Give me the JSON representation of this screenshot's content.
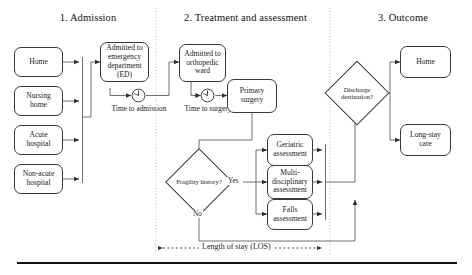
{
  "diagram": {
    "title_phases": [
      {
        "id": "phase-1",
        "label": "1. Admission"
      },
      {
        "id": "phase-2",
        "label": "2. Treatment and assessment"
      },
      {
        "id": "phase-3",
        "label": "3. Outcome"
      }
    ],
    "admission": {
      "sources": [
        {
          "id": "source-home",
          "label": "Home"
        },
        {
          "id": "source-nursing-home",
          "label": "Nursing home"
        },
        {
          "id": "source-acute-hospital",
          "label": "Acute hospital"
        },
        {
          "id": "source-non-acute-hospital",
          "label": "Non-acute hospital"
        }
      ],
      "ed_node": "Admitted to emergency department (ED)",
      "time_to_admission": "Time to admission"
    },
    "treatment": {
      "ward_node": "Admitted to orthopedic ward",
      "time_to_surgery": "Time to surgery",
      "primary_surgery": "Primary surgery",
      "decision": "Fragility history?",
      "decision_yes": "Yes",
      "decision_no": "No",
      "assessments": [
        {
          "id": "assessment-geriatric",
          "label": "Geriatric assessment"
        },
        {
          "id": "assessment-multidisciplinary",
          "label": "Multi-disciplinary assessment"
        },
        {
          "id": "assessment-falls",
          "label": "Falls assessment"
        }
      ]
    },
    "outcome": {
      "decision": "Discharge destination?",
      "destinations": [
        {
          "id": "outcome-home",
          "label": "Home"
        },
        {
          "id": "outcome-long-stay-care",
          "label": "Long-stay care"
        }
      ]
    },
    "annotations": {
      "los": "Length of stay (LOS)"
    },
    "colors": {
      "background": "#ffffff",
      "node_stroke": "#3a3a3a",
      "connector": "#555555",
      "divider": "#b8b8b8",
      "text": "#1a1a1a",
      "rule": "#111111"
    }
  }
}
